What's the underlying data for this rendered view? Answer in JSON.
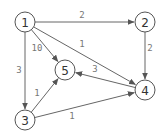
{
  "diagram": {
    "type": "directed-weighted-graph",
    "nodes": [
      {
        "id": "1",
        "label": "1",
        "x": 25,
        "y": 22
      },
      {
        "id": "2",
        "label": "2",
        "x": 145,
        "y": 22
      },
      {
        "id": "3",
        "label": "3",
        "x": 25,
        "y": 120
      },
      {
        "id": "4",
        "label": "4",
        "x": 145,
        "y": 90
      },
      {
        "id": "5",
        "label": "5",
        "x": 65,
        "y": 70
      }
    ],
    "edges": [
      {
        "from": "1",
        "to": "2",
        "weight": "2",
        "label_x": 82,
        "label_y": 15
      },
      {
        "from": "1",
        "to": "4",
        "weight": "1",
        "label_x": 82,
        "label_y": 44
      },
      {
        "from": "1",
        "to": "5",
        "weight": "10",
        "label_x": 37,
        "label_y": 48
      },
      {
        "from": "1",
        "to": "3",
        "weight": "3",
        "label_x": 19,
        "label_y": 70
      },
      {
        "from": "2",
        "to": "4",
        "weight": "2",
        "label_x": 150,
        "label_y": 48
      },
      {
        "from": "4",
        "to": "5",
        "weight": "3",
        "label_x": 95,
        "label_y": 69
      },
      {
        "from": "3",
        "to": "5",
        "weight": "1",
        "label_x": 37,
        "label_y": 93
      },
      {
        "from": "3",
        "to": "4",
        "weight": "1",
        "label_x": 72,
        "label_y": 116
      }
    ],
    "node_radius": 10,
    "colors": {
      "node_stroke": "#555555",
      "node_fill": "#ffffff",
      "node_text": "#333333",
      "edge": "#666666",
      "edge_label": "#777777"
    }
  }
}
